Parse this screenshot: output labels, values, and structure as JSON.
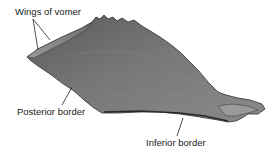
{
  "figure": {
    "colors": {
      "bone_fill": "#6e6e6e",
      "bone_light": "#8f8f8f",
      "bone_dark": "#3a3a3a",
      "leader_line": "#222222",
      "label_text": "#1a1a1a",
      "background": "#ffffff"
    }
  },
  "labels": {
    "wings": "Wings of vomer",
    "posterior": "Posterior border",
    "inferior": "Inferior border"
  }
}
